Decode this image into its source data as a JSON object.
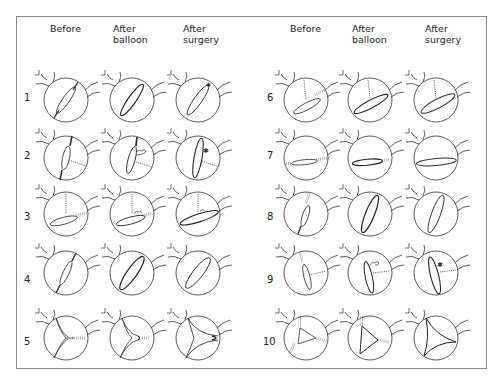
{
  "figure": {
    "left_group": {
      "headers": [
        "Before",
        "After\nballoon",
        "After\nsurgery"
      ],
      "header_lines": [
        [
          "Before"
        ],
        [
          "After",
          "balloon"
        ],
        [
          "After",
          "surgery"
        ]
      ],
      "rows": [
        "1",
        "2",
        "3",
        "4",
        "5"
      ]
    },
    "right_group": {
      "headers": [
        "Before",
        "After\nballoon",
        "After\nsurgery"
      ],
      "header_lines": [
        [
          "Before"
        ],
        [
          "After",
          "balloon"
        ],
        [
          "After",
          "surgery"
        ]
      ],
      "rows": [
        "6",
        "7",
        "8",
        "9",
        "10"
      ]
    },
    "colors": {
      "line": "#333333",
      "border": "#8a8a8a",
      "background": "#ffffff"
    }
  }
}
